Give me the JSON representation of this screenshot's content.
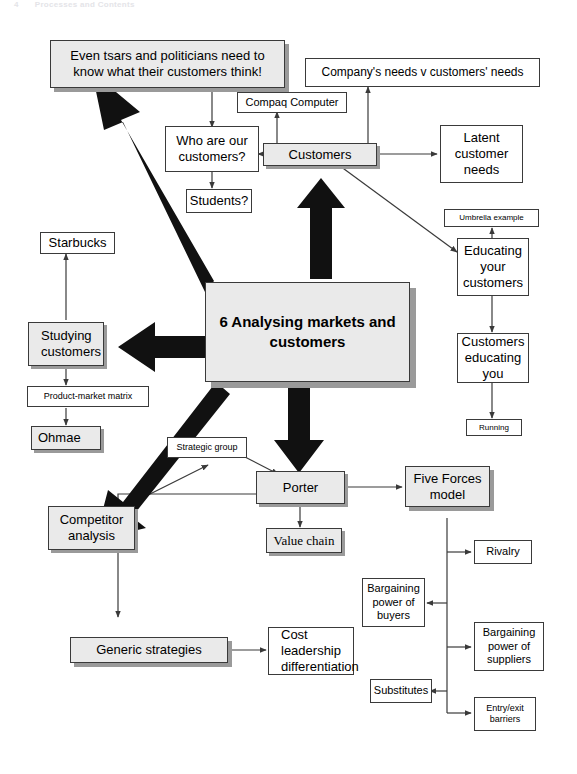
{
  "header": {
    "page_number": "4",
    "title": "Processes and Contents"
  },
  "diagram": {
    "type": "mind-map",
    "accent_fill": "#eaeaea",
    "shadow_color": "#9a9a9a",
    "line_color": "#3a3a3a",
    "hub": {
      "label": "6 Analysing markets and customers",
      "line1": "6 Analysing",
      "line2": "markets and",
      "line3": "customers"
    },
    "nodes": [
      {
        "id": "tsars",
        "label": "Even tsars and politicians need to know what their customers think!"
      },
      {
        "id": "company-needs",
        "label": "Company's needs v customers' needs"
      },
      {
        "id": "compaq",
        "label": "Compaq Computer"
      },
      {
        "id": "who-are",
        "label": "Who are our customers?"
      },
      {
        "id": "customers",
        "label": "Customers"
      },
      {
        "id": "students",
        "label": "Students?"
      },
      {
        "id": "latent",
        "label": "Latent customer needs"
      },
      {
        "id": "umbrella",
        "label": "Umbrella example"
      },
      {
        "id": "educating-your",
        "label": "Educating your customers"
      },
      {
        "id": "cust-educating",
        "label": "Customers educating you"
      },
      {
        "id": "running",
        "label": "Running"
      },
      {
        "id": "starbucks",
        "label": "Starbucks"
      },
      {
        "id": "studying",
        "label": "Studying customers"
      },
      {
        "id": "pmm",
        "label": "Product-market matrix"
      },
      {
        "id": "ohmae",
        "label": "Ohmae"
      },
      {
        "id": "strategic-group",
        "label": "Strategic group"
      },
      {
        "id": "competitor",
        "label": "Competitor analysis"
      },
      {
        "id": "porter",
        "label": "Porter"
      },
      {
        "id": "value-chain",
        "label": "Value chain"
      },
      {
        "id": "five-forces",
        "label": "Five Forces model"
      },
      {
        "id": "rivalry",
        "label": "Rivalry"
      },
      {
        "id": "bp-buyers",
        "label": "Bargaining power of buyers"
      },
      {
        "id": "bp-suppliers",
        "label": "Bargaining power of suppliers"
      },
      {
        "id": "substitutes",
        "label": "Substitutes"
      },
      {
        "id": "entry-exit",
        "label": "Entry/exit barriers"
      },
      {
        "id": "generic",
        "label": "Generic strategies"
      },
      {
        "id": "cost-lead",
        "label": "Cost leadership differentiation"
      }
    ]
  },
  "labels": {
    "tsars_l1": "Even tsars and politicians need to",
    "tsars_l2": "know what their customers think!",
    "company_needs": "Company's needs v customers' needs",
    "compaq": "Compaq Computer",
    "who_l1": "Who are our",
    "who_l2": "customers?",
    "customers": "Customers",
    "students": "Students?",
    "latent_l1": "Latent",
    "latent_l2": "customer",
    "latent_l3": "needs",
    "umbrella": "Umbrella example",
    "edu_l1": "Educating",
    "edu_l2": "your",
    "edu_l3": "customers",
    "cedu_l1": "Customers",
    "cedu_l2": "educating",
    "cedu_l3": "you",
    "running": "Running",
    "starbucks": "Starbucks",
    "study_l1": "Studying",
    "study_l2": "customers",
    "pmm": "Product-market matrix",
    "ohmae": "Ohmae",
    "strategic_group": "Strategic group",
    "comp_l1": "Competitor",
    "comp_l2": "analysis",
    "porter": "Porter",
    "value_chain": "Value chain",
    "ff_l1": "Five Forces",
    "ff_l2": "model",
    "rivalry": "Rivalry",
    "bpb_l1": "Bargaining",
    "bpb_l2": "power of",
    "bpb_l3": "buyers",
    "bps_l1": "Bargaining",
    "bps_l2": "power of",
    "bps_l3": "suppliers",
    "substitutes": "Substitutes",
    "ee_l1": "Entry/exit",
    "ee_l2": "barriers",
    "generic": "Generic strategies",
    "cost_l1": "Cost leadership",
    "cost_l2": "differentiation"
  }
}
